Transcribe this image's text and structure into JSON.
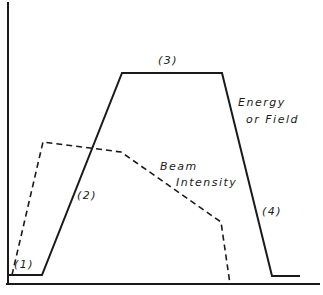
{
  "diagram": {
    "type": "pulse-timing-sketch",
    "colors": {
      "line": "#1a1a1a",
      "background": "#ffffff"
    },
    "curves": [
      {
        "name": "Energy or Field",
        "style": "solid",
        "points": [
          [
            9,
            275
          ],
          [
            42,
            275
          ],
          [
            122,
            73
          ],
          [
            222,
            73
          ],
          [
            272,
            276
          ],
          [
            300,
            276
          ]
        ]
      },
      {
        "name": "Beam Intensity",
        "style": "dashed",
        "points": [
          [
            12,
            275
          ],
          [
            43,
            142
          ],
          [
            121,
            152
          ],
          [
            221,
            222
          ],
          [
            230,
            284
          ]
        ]
      }
    ],
    "labels": {
      "phase1": "(1)",
      "phase2": "(2)",
      "phase3": "(3)",
      "phase4": "(4)",
      "energy_line1": "Energy",
      "energy_line2": "or Field",
      "beam_line1": "Beam",
      "beam_line2": "Intensity"
    }
  }
}
